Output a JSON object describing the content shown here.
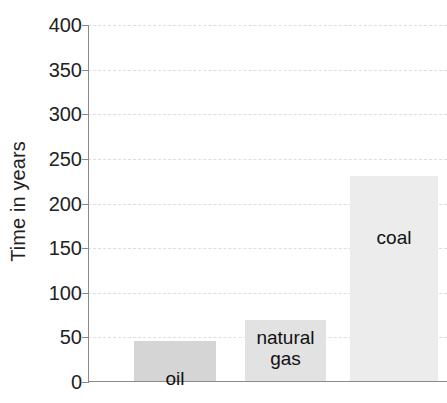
{
  "chart_data": {
    "type": "bar",
    "title": "",
    "subtitle": "",
    "xlabel": "",
    "ylabel": "Time in years",
    "categories": [
      "oil",
      "natural\ngas",
      "coal"
    ],
    "values": [
      45,
      68,
      230
    ],
    "ylim": [
      0,
      400
    ],
    "yticks": [
      0,
      50,
      100,
      150,
      200,
      250,
      300,
      350,
      400
    ],
    "ytick_labels": [
      "0",
      "50",
      "100",
      "150",
      "200",
      "250",
      "300",
      "350",
      "400"
    ],
    "grid": true,
    "grid_style": "dashed",
    "legend": "none",
    "bar_colors": [
      "#d5d5d5",
      "#e2e2e2",
      "#ececec"
    ],
    "series": [
      {
        "name": "Time in years",
        "values": [
          45,
          68,
          230
        ]
      }
    ]
  },
  "axis": {
    "y_title": "Time in years",
    "ticks": [
      {
        "value": 400,
        "label": "400"
      },
      {
        "value": 350,
        "label": "350"
      },
      {
        "value": 300,
        "label": "300"
      },
      {
        "value": 250,
        "label": "250"
      },
      {
        "value": 200,
        "label": "200"
      },
      {
        "value": 150,
        "label": "150"
      },
      {
        "value": 100,
        "label": "100"
      },
      {
        "value": 50,
        "label": "50"
      },
      {
        "value": 0,
        "label": "0"
      }
    ]
  },
  "bars": [
    {
      "name": "oil",
      "label": "oil",
      "value": 45,
      "color": "#d5d5d5"
    },
    {
      "name": "natural-gas",
      "label": "natural\ngas",
      "value": 68,
      "color": "#e2e2e2"
    },
    {
      "name": "coal",
      "label": "coal",
      "value": 230,
      "color": "#ececec"
    }
  ],
  "colors": {
    "axis": "#8a8a8a",
    "grid": "#dedede",
    "text": "#222222"
  }
}
